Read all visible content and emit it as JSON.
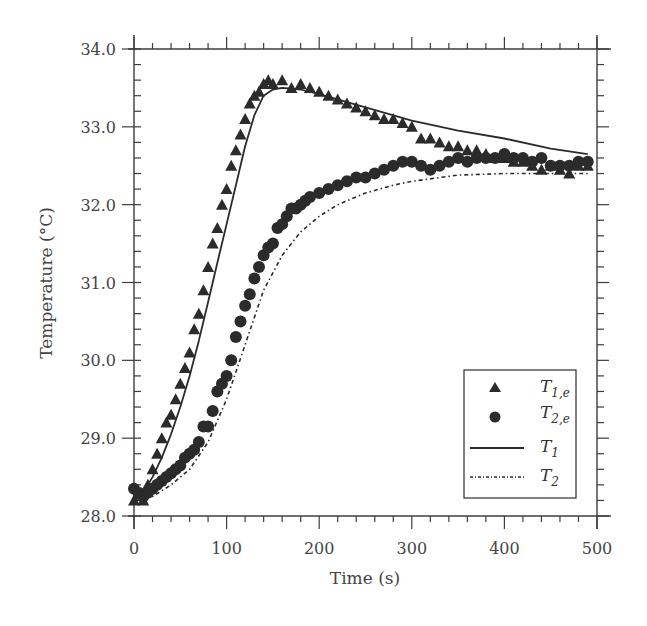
{
  "chart_data": {
    "type": "scatter",
    "title": "",
    "xlabel": "Time (s)",
    "ylabel": "Temperature (°C)",
    "xlim": [
      0,
      500
    ],
    "ylim": [
      28.0,
      34.0
    ],
    "xticks": [
      0,
      100,
      200,
      300,
      400,
      500
    ],
    "xtick_labels": [
      "0",
      "100",
      "200",
      "300",
      "400",
      "500"
    ],
    "yticks": [
      28.0,
      29.0,
      30.0,
      31.0,
      32.0,
      33.0,
      34.0
    ],
    "ytick_labels": [
      "28.0",
      "29.0",
      "30.0",
      "31.0",
      "32.0",
      "33.0",
      "34.0"
    ],
    "grid": false,
    "legend_position": "lower right",
    "series": [
      {
        "name": "T1,e",
        "label_main": "T",
        "label_sub": "1,e",
        "kind": "markers",
        "marker": "triangle",
        "x": [
          0,
          5,
          10,
          15,
          20,
          25,
          30,
          35,
          40,
          45,
          50,
          55,
          60,
          65,
          70,
          75,
          80,
          85,
          90,
          95,
          100,
          105,
          110,
          115,
          120,
          125,
          130,
          135,
          140,
          145,
          150,
          160,
          170,
          180,
          190,
          200,
          210,
          220,
          230,
          240,
          250,
          260,
          270,
          280,
          290,
          300,
          310,
          320,
          330,
          340,
          350,
          360,
          370,
          380,
          390,
          400,
          410,
          420,
          430,
          440,
          450,
          460,
          470,
          480,
          490
        ],
        "y": [
          28.2,
          28.3,
          28.2,
          28.4,
          28.6,
          28.8,
          29.0,
          29.2,
          29.3,
          29.5,
          29.7,
          29.9,
          30.1,
          30.4,
          30.6,
          30.9,
          31.2,
          31.5,
          31.7,
          32.0,
          32.2,
          32.5,
          32.7,
          32.9,
          33.1,
          33.3,
          33.4,
          33.45,
          33.55,
          33.6,
          33.55,
          33.6,
          33.5,
          33.55,
          33.5,
          33.45,
          33.4,
          33.35,
          33.3,
          33.25,
          33.2,
          33.15,
          33.1,
          33.1,
          33.05,
          33.0,
          32.85,
          32.85,
          32.8,
          32.75,
          32.75,
          32.7,
          32.7,
          32.65,
          32.6,
          32.6,
          32.55,
          32.55,
          32.5,
          32.45,
          32.5,
          32.45,
          32.4,
          32.5,
          32.5
        ]
      },
      {
        "name": "T2,e",
        "label_main": "T",
        "label_sub": "2,e",
        "kind": "markers",
        "marker": "circle",
        "x": [
          0,
          5,
          10,
          15,
          20,
          25,
          30,
          35,
          40,
          45,
          50,
          55,
          60,
          65,
          70,
          75,
          80,
          85,
          90,
          95,
          100,
          105,
          110,
          115,
          120,
          125,
          130,
          135,
          140,
          145,
          150,
          155,
          160,
          165,
          170,
          175,
          180,
          185,
          190,
          200,
          210,
          220,
          230,
          240,
          250,
          260,
          270,
          280,
          290,
          300,
          310,
          320,
          330,
          340,
          350,
          360,
          370,
          380,
          390,
          400,
          410,
          420,
          430,
          440,
          450,
          460,
          470,
          480,
          490
        ],
        "y": [
          28.35,
          28.3,
          28.25,
          28.3,
          28.35,
          28.4,
          28.45,
          28.5,
          28.55,
          28.6,
          28.65,
          28.75,
          28.8,
          28.85,
          28.95,
          29.15,
          29.15,
          29.35,
          29.6,
          29.7,
          29.8,
          30.0,
          30.3,
          30.5,
          30.7,
          30.85,
          31.05,
          31.2,
          31.35,
          31.45,
          31.5,
          31.7,
          31.75,
          31.85,
          31.95,
          31.95,
          32.0,
          32.05,
          32.1,
          32.15,
          32.2,
          32.25,
          32.3,
          32.35,
          32.35,
          32.4,
          32.45,
          32.5,
          32.55,
          32.55,
          32.5,
          32.45,
          32.5,
          32.55,
          32.6,
          32.55,
          32.6,
          32.6,
          32.6,
          32.65,
          32.6,
          32.6,
          32.55,
          32.6,
          32.5,
          32.5,
          32.5,
          32.55,
          32.55
        ]
      },
      {
        "name": "T1",
        "label_main": "T",
        "label_sub": "1",
        "kind": "line",
        "style": "solid",
        "x": [
          0,
          10,
          20,
          30,
          40,
          50,
          60,
          70,
          80,
          90,
          100,
          110,
          120,
          130,
          140,
          150,
          160,
          180,
          200,
          250,
          300,
          350,
          400,
          450,
          490
        ],
        "y": [
          28.2,
          28.3,
          28.5,
          28.75,
          29.05,
          29.4,
          29.8,
          30.25,
          30.75,
          31.25,
          31.75,
          32.25,
          32.75,
          33.15,
          33.4,
          33.48,
          33.5,
          33.48,
          33.42,
          33.25,
          33.08,
          32.95,
          32.85,
          32.72,
          32.65
        ]
      },
      {
        "name": "T2",
        "label_main": "T",
        "label_sub": "2",
        "kind": "line",
        "style": "dash-dot",
        "x": [
          0,
          20,
          40,
          60,
          80,
          100,
          120,
          140,
          160,
          180,
          200,
          220,
          250,
          280,
          300,
          350,
          400,
          450,
          490
        ],
        "y": [
          28.2,
          28.25,
          28.4,
          28.6,
          28.95,
          29.5,
          30.2,
          30.9,
          31.35,
          31.65,
          31.85,
          32.0,
          32.15,
          32.25,
          32.3,
          32.38,
          32.4,
          32.4,
          32.4
        ]
      }
    ],
    "colors": {
      "ink": "#2b2b2b",
      "axis": "#3c3c3c",
      "text": "#444444",
      "background": "#ffffff"
    }
  },
  "legend": {
    "entries": [
      {
        "main": "T",
        "sub": "1,e"
      },
      {
        "main": "T",
        "sub": "2,e"
      },
      {
        "main": "T",
        "sub": "1"
      },
      {
        "main": "T",
        "sub": "2"
      }
    ]
  },
  "axes": {
    "xlabel": "Time (s)",
    "ylabel": "Temperature (°C)"
  }
}
